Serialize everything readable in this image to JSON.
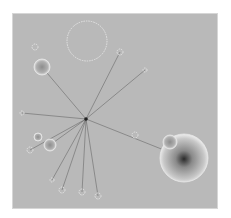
{
  "diagram": {
    "type": "radial-network-graph",
    "background_color": "#b9b9b9",
    "hub": {
      "x": 86,
      "y": 119
    },
    "edge_color": "#555555",
    "nodes": [
      {
        "id": "large-bubble-br",
        "x": 184,
        "y": 158,
        "r": 24,
        "style": "radial-dark-core"
      },
      {
        "id": "small-bubble-br",
        "x": 170,
        "y": 142,
        "r": 7,
        "style": "radial"
      },
      {
        "id": "outline-circle-top",
        "x": 87,
        "y": 41,
        "r": 20,
        "style": "outline"
      },
      {
        "id": "bubble-tl",
        "x": 42,
        "y": 67,
        "r": 8,
        "style": "radial"
      },
      {
        "id": "bubble-left-1",
        "x": 38,
        "y": 137,
        "r": 4,
        "style": "radial"
      },
      {
        "id": "bubble-left-2",
        "x": 50,
        "y": 145,
        "r": 6,
        "style": "radial"
      },
      {
        "id": "cluster-top-right",
        "x": 120,
        "y": 52,
        "r": 3,
        "style": "outline"
      },
      {
        "id": "cluster-right",
        "x": 145,
        "y": 70,
        "r": 2,
        "style": "outline"
      },
      {
        "id": "cluster-mid-right",
        "x": 135,
        "y": 135,
        "r": 3,
        "style": "outline"
      },
      {
        "id": "cluster-top-left",
        "x": 35,
        "y": 47,
        "r": 3,
        "style": "outline"
      },
      {
        "id": "bar-left",
        "x": 22,
        "y": 113,
        "r": 2,
        "style": "outline"
      },
      {
        "id": "cluster-bottom-1",
        "x": 52,
        "y": 180,
        "r": 2,
        "style": "outline"
      },
      {
        "id": "cluster-bottom-2",
        "x": 62,
        "y": 190,
        "r": 3,
        "style": "outline"
      },
      {
        "id": "cluster-bottom-3",
        "x": 82,
        "y": 192,
        "r": 3,
        "style": "outline"
      },
      {
        "id": "cluster-bottom-4",
        "x": 98,
        "y": 196,
        "r": 3,
        "style": "outline"
      },
      {
        "id": "cluster-left-lower",
        "x": 30,
        "y": 150,
        "r": 3,
        "style": "outline"
      }
    ],
    "edges": [
      {
        "to": "bubble-tl"
      },
      {
        "to": "cluster-top-right"
      },
      {
        "to": "cluster-right"
      },
      {
        "to": "bar-left"
      },
      {
        "to": "large-bubble-br"
      },
      {
        "to": "bubble-left-2"
      },
      {
        "to": "cluster-bottom-1"
      },
      {
        "to": "cluster-bottom-2"
      },
      {
        "to": "cluster-bottom-3"
      },
      {
        "to": "cluster-bottom-4"
      },
      {
        "to": "cluster-left-lower"
      }
    ]
  }
}
